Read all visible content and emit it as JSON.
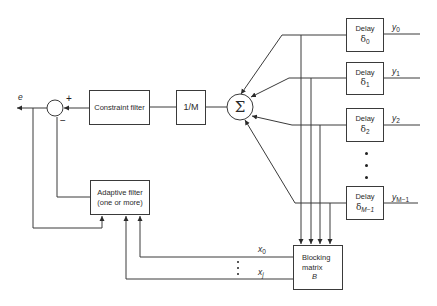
{
  "diagram": {
    "type": "block-diagram",
    "blocks": {
      "constraint_filter": "Constraint filter",
      "scale": "1/M",
      "sum": "Σ",
      "adaptive_filter": {
        "line1": "Adaptive filter",
        "line2": "(one or more)"
      },
      "blocking_matrix": {
        "line1": "Blocking",
        "line2": "matrix",
        "symbol": "B"
      },
      "delays": [
        {
          "label": "Delay",
          "symbol": "δ",
          "index": "0",
          "output": "y",
          "output_index": "0"
        },
        {
          "label": "Delay",
          "symbol": "δ",
          "index": "1",
          "output": "y",
          "output_index": "1"
        },
        {
          "label": "Delay",
          "symbol": "δ",
          "index": "2",
          "output": "y",
          "output_index": "2"
        },
        {
          "label": "Delay",
          "symbol": "δ",
          "index": "M−1",
          "output": "y",
          "output_index": "M−1"
        }
      ]
    },
    "signals": {
      "error": "e",
      "x0": {
        "symbol": "x",
        "index": "0"
      },
      "xj": {
        "symbol": "x",
        "index": "j"
      }
    },
    "junction": {
      "plus": "+",
      "minus": "−"
    },
    "colors": {
      "line": "#3a3a3a",
      "background": "#ffffff"
    }
  }
}
